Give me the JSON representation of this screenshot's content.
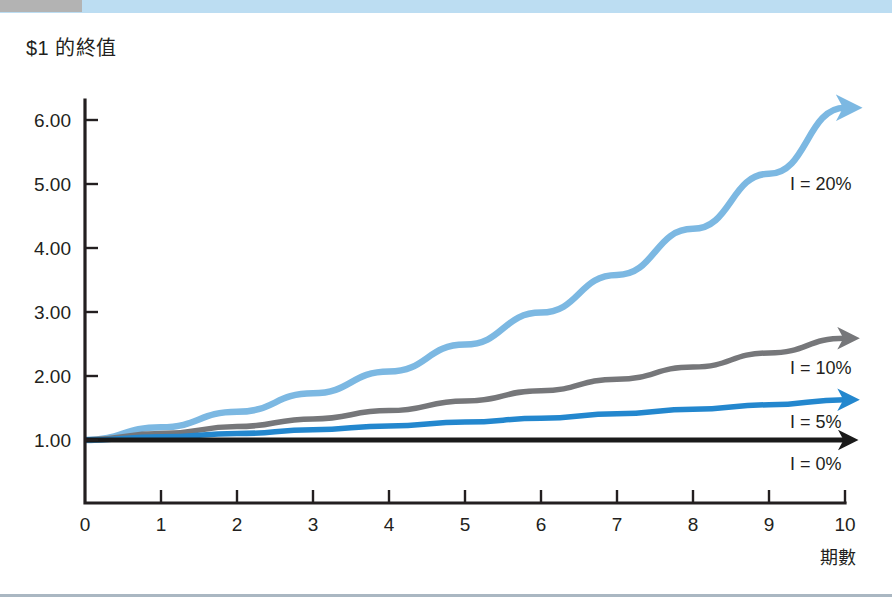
{
  "decor": {
    "top_bar_color": "#bcddf2",
    "top_bar_tab_color": "#b3b3b3",
    "bottom_rule_color": "#aab7c2"
  },
  "chart_data": {
    "type": "line",
    "title": "$1 的終值",
    "xlabel": "期數",
    "ylabel": "",
    "xlim": [
      0,
      10
    ],
    "ylim": [
      0,
      6.6
    ],
    "grid": false,
    "legend_position": "right-inline",
    "x": [
      0,
      1,
      2,
      3,
      4,
      5,
      6,
      7,
      8,
      9,
      10
    ],
    "xticks": [
      "0",
      "1",
      "2",
      "3",
      "4",
      "5",
      "6",
      "7",
      "8",
      "9",
      "10"
    ],
    "yticks": [
      "1.00",
      "2.00",
      "3.00",
      "4.00",
      "5.00",
      "6.00"
    ],
    "ytick_values": [
      1,
      2,
      3,
      4,
      5,
      6
    ],
    "series": [
      {
        "name": "I = 20%",
        "label": "I = 20%",
        "color": "#7cb8e2",
        "width": 6.5,
        "values": [
          1.0,
          1.2,
          1.44,
          1.73,
          2.07,
          2.49,
          2.99,
          3.58,
          4.3,
          5.16,
          6.19
        ],
        "label_x": 790,
        "label_y": 190
      },
      {
        "name": "I = 10%",
        "label": "I = 10%",
        "color": "#76777a",
        "width": 5.5,
        "values": [
          1.0,
          1.1,
          1.21,
          1.33,
          1.46,
          1.61,
          1.77,
          1.95,
          2.14,
          2.36,
          2.59
        ],
        "label_x": 790,
        "label_y": 374
      },
      {
        "name": "I = 5%",
        "label": "I = 5%",
        "color": "#2387ce",
        "width": 5.5,
        "values": [
          1.0,
          1.05,
          1.1,
          1.16,
          1.22,
          1.28,
          1.34,
          1.41,
          1.48,
          1.55,
          1.63
        ],
        "label_x": 790,
        "label_y": 428
      },
      {
        "name": "I = 0%",
        "label": "I = 0%",
        "color": "#1a1a1a",
        "width": 5.0,
        "values": [
          1.0,
          1.0,
          1.0,
          1.0,
          1.0,
          1.0,
          1.0,
          1.0,
          1.0,
          1.0,
          1.0
        ],
        "label_x": 790,
        "label_y": 470
      }
    ]
  },
  "axis_title": {
    "x": "期數"
  }
}
